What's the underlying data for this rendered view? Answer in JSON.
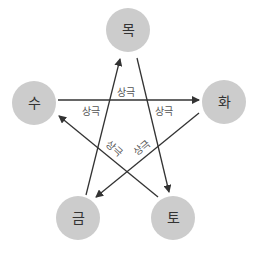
{
  "diagram": {
    "colors": {
      "node_fill": "#cccccc",
      "line": "#333333",
      "text": "#333333"
    },
    "nodes": [
      {
        "id": "wood",
        "label": "목",
        "cx": 128,
        "cy": 30,
        "r": 22
      },
      {
        "id": "fire",
        "label": "화",
        "cx": 224,
        "cy": 102,
        "r": 22
      },
      {
        "id": "earth",
        "label": "토",
        "cx": 173,
        "cy": 218,
        "r": 22
      },
      {
        "id": "metal",
        "label": "금",
        "cx": 78,
        "cy": 218,
        "r": 22
      },
      {
        "id": "water",
        "label": "수",
        "cx": 34,
        "cy": 103,
        "r": 22
      }
    ],
    "edges": [
      {
        "from": "목",
        "to": "토",
        "label": "상극"
      },
      {
        "from": "토",
        "to": "수",
        "label": "상극"
      },
      {
        "from": "수",
        "to": "화",
        "label": "상극"
      },
      {
        "from": "화",
        "to": "금",
        "label": "상극"
      },
      {
        "from": "금",
        "to": "목",
        "label": "상극"
      }
    ],
    "caption": ""
  }
}
